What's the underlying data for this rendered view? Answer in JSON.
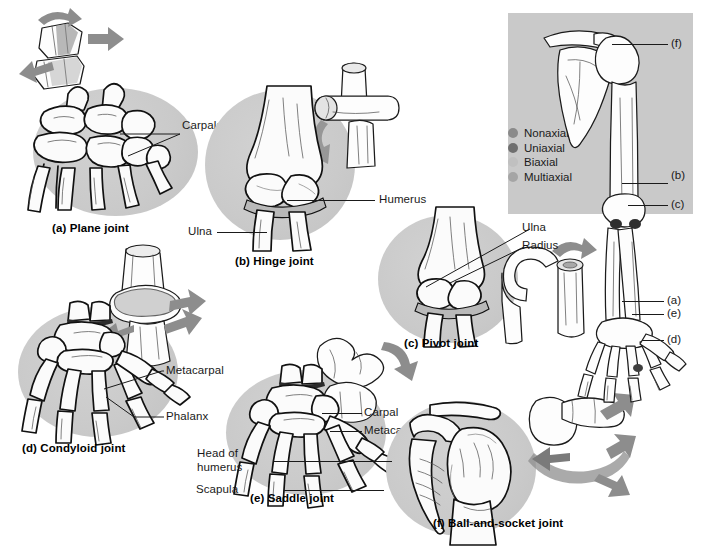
{
  "figure": {
    "background_color": "#ffffff",
    "panel_color": "#c9c9c9",
    "vignette_color": "#c8c8c8"
  },
  "panels": [
    {
      "id": "a",
      "caption": "(a) Plane joint",
      "labels": [
        {
          "text": "Carpals"
        }
      ]
    },
    {
      "id": "b",
      "caption": "(b) Hinge joint",
      "labels": [
        {
          "text": "Humerus"
        },
        {
          "text": "Ulna"
        }
      ]
    },
    {
      "id": "c",
      "caption": "(c) Pivot joint",
      "labels": [
        {
          "text": "Ulna"
        },
        {
          "text": "Radius"
        }
      ]
    },
    {
      "id": "d",
      "caption": "(d) Condyloid joint",
      "labels": [
        {
          "text": "Metacarpal"
        },
        {
          "text": "Phalanx"
        }
      ]
    },
    {
      "id": "e",
      "caption": "(e) Saddle joint",
      "labels": [
        {
          "text": "Carpal"
        },
        {
          "text": "Metacarpal #1"
        }
      ]
    },
    {
      "id": "f",
      "caption": "(f) Ball-and-socket joint",
      "labels": [
        {
          "text": "Head of"
        },
        {
          "text": "humerus"
        },
        {
          "text": "Scapula"
        }
      ]
    }
  ],
  "reference_panel": {
    "legend": {
      "items": [
        {
          "label": "Nonaxial",
          "color": "#8a8a8a"
        },
        {
          "label": "Uniaxial",
          "color": "#6f6f6f"
        },
        {
          "label": "Biaxial",
          "color": "#c0c0c0"
        },
        {
          "label": "Multiaxial",
          "color": "#a5a5a5"
        }
      ]
    },
    "callouts": [
      {
        "text": "(f)"
      },
      {
        "text": "(b)"
      },
      {
        "text": "(c)"
      },
      {
        "text": "(a)"
      },
      {
        "text": "(e)"
      },
      {
        "text": "(d)"
      }
    ]
  }
}
